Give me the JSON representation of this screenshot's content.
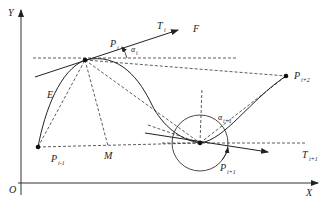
{
  "diagram": {
    "axes": {
      "x_label": "X",
      "y_label": "Y",
      "origin_label": "O"
    },
    "points": [
      {
        "id": "P_i",
        "label": "P",
        "sub": "i",
        "x": 85,
        "y": 60
      },
      {
        "id": "P_i-1",
        "label": "P",
        "sub": "i-1",
        "x": 38,
        "y": 147
      },
      {
        "id": "P_i+1",
        "label": "P",
        "sub": "i+1",
        "x": 200,
        "y": 143
      },
      {
        "id": "P_i+2",
        "label": "P",
        "sub": "i+2",
        "x": 286,
        "y": 76
      },
      {
        "id": "M",
        "label": "M",
        "x": 108,
        "y": 146
      }
    ],
    "labels": {
      "E": "E",
      "F": "F",
      "T_i": "T",
      "T_i_sub": "i",
      "T_i1": "T",
      "T_i1_sub": "i+1",
      "alpha_i": "α",
      "alpha_i_sub": "i",
      "alpha_i1": "α",
      "alpha_i1_sub": "i+1",
      "P_i": "P",
      "P_i_sub": "i",
      "P_im1": "P",
      "P_im1_sub": "i-1",
      "P_ip1": "P",
      "P_ip1_sub": "i+1",
      "P_ip2": "P",
      "P_ip2_sub": "i+2",
      "M": "M"
    },
    "colors": {
      "stroke": "#222222",
      "background": "#ffffff"
    }
  }
}
